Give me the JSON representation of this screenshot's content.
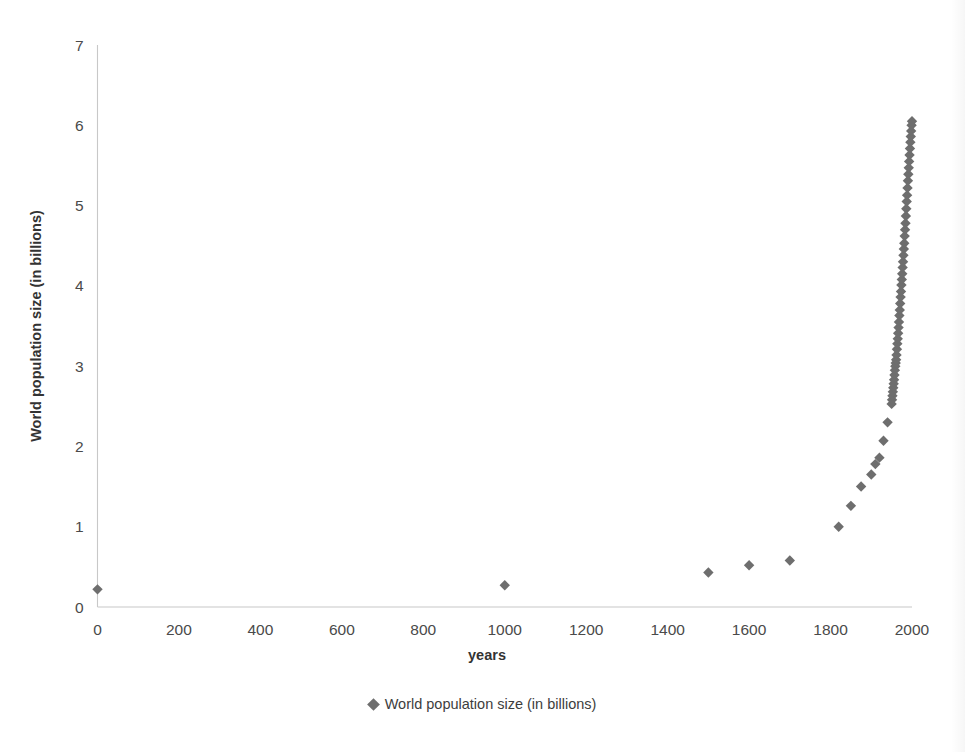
{
  "chart_data": {
    "type": "scatter",
    "title": "",
    "xlabel": "years",
    "ylabel": "World population size (in billions)",
    "xlim": [
      0,
      2000
    ],
    "ylim": [
      0,
      7
    ],
    "xticks": [
      0,
      200,
      400,
      600,
      800,
      1000,
      1200,
      1400,
      1600,
      1800,
      2000
    ],
    "yticks": [
      0,
      1,
      2,
      3,
      4,
      5,
      6,
      7
    ],
    "grid": false,
    "legend_position": "bottom-center",
    "marker": "diamond",
    "marker_color": "#6e6e6e",
    "series": [
      {
        "name": "World population size (in billions)",
        "points": [
          [
            0,
            0.22
          ],
          [
            1000,
            0.27
          ],
          [
            1500,
            0.43
          ],
          [
            1600,
            0.52
          ],
          [
            1700,
            0.58
          ],
          [
            1820,
            1.0
          ],
          [
            1850,
            1.26
          ],
          [
            1875,
            1.5
          ],
          [
            1900,
            1.65
          ],
          [
            1910,
            1.78
          ],
          [
            1920,
            1.86
          ],
          [
            1930,
            2.07
          ],
          [
            1940,
            2.3
          ],
          [
            1950,
            2.53
          ],
          [
            1951,
            2.58
          ],
          [
            1952,
            2.63
          ],
          [
            1953,
            2.68
          ],
          [
            1954,
            2.73
          ],
          [
            1955,
            2.78
          ],
          [
            1956,
            2.83
          ],
          [
            1957,
            2.89
          ],
          [
            1958,
            2.95
          ],
          [
            1959,
            3.0
          ],
          [
            1960,
            3.04
          ],
          [
            1961,
            3.08
          ],
          [
            1962,
            3.14
          ],
          [
            1963,
            3.21
          ],
          [
            1964,
            3.28
          ],
          [
            1965,
            3.34
          ],
          [
            1966,
            3.41
          ],
          [
            1967,
            3.48
          ],
          [
            1968,
            3.55
          ],
          [
            1969,
            3.63
          ],
          [
            1970,
            3.7
          ],
          [
            1971,
            3.78
          ],
          [
            1972,
            3.86
          ],
          [
            1973,
            3.93
          ],
          [
            1974,
            4.01
          ],
          [
            1975,
            4.08
          ],
          [
            1976,
            4.15
          ],
          [
            1977,
            4.23
          ],
          [
            1978,
            4.3
          ],
          [
            1979,
            4.38
          ],
          [
            1980,
            4.46
          ],
          [
            1981,
            4.53
          ],
          [
            1982,
            4.62
          ],
          [
            1983,
            4.7
          ],
          [
            1984,
            4.78
          ],
          [
            1985,
            4.87
          ],
          [
            1986,
            4.96
          ],
          [
            1987,
            5.05
          ],
          [
            1988,
            5.13
          ],
          [
            1989,
            5.22
          ],
          [
            1990,
            5.31
          ],
          [
            1991,
            5.39
          ],
          [
            1992,
            5.47
          ],
          [
            1993,
            5.55
          ],
          [
            1994,
            5.63
          ],
          [
            1995,
            5.71
          ],
          [
            1996,
            5.79
          ],
          [
            1997,
            5.86
          ],
          [
            1998,
            5.93
          ],
          [
            1999,
            6.0
          ],
          [
            2000,
            6.05
          ]
        ]
      }
    ]
  },
  "legend": {
    "entries": [
      {
        "label": "World population size (in billions)",
        "marker": "diamond-marker",
        "color": "#6e6e6e"
      }
    ]
  },
  "axes": {
    "x_title": "years",
    "y_title": "World population size (in billions)"
  }
}
